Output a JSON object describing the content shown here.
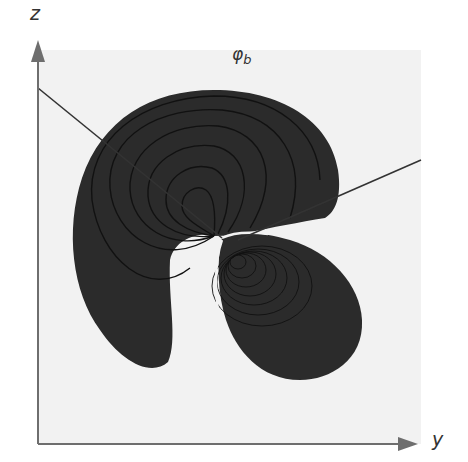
{
  "figure": {
    "title_label": "φ",
    "title_subscript": "b",
    "axes": {
      "vertical_label": "z",
      "horizontal_label": "y"
    },
    "colors": {
      "background_panel": "#f2f2f2",
      "lobe_fill": "#2b2b2b",
      "contour_line": "#111111",
      "axis": "#6e6e6e",
      "nodal_line": "#333333"
    }
  }
}
